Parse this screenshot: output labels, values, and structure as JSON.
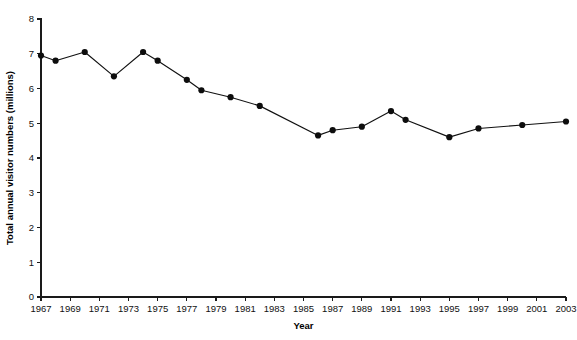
{
  "chart_data": {
    "type": "line",
    "title": "",
    "xlabel": "Year",
    "ylabel": "Total annual visitor numbers (millions)",
    "xlim": [
      1967,
      2003
    ],
    "ylim": [
      0,
      8
    ],
    "grid": false,
    "legend": false,
    "marker": "filled-circle",
    "x_tick_labels": [
      "1967",
      "1969",
      "1971",
      "1973",
      "1975",
      "1977",
      "1979",
      "1981",
      "1983",
      "1985",
      "1987",
      "1989",
      "1991",
      "1993",
      "1995",
      "1997",
      "1999",
      "2001",
      "2003"
    ],
    "x_ticks": [
      1967,
      1969,
      1971,
      1973,
      1975,
      1977,
      1979,
      1981,
      1983,
      1985,
      1987,
      1989,
      1991,
      1993,
      1995,
      1997,
      1999,
      2001,
      2003
    ],
    "y_tick_labels": [
      "0",
      "1",
      "2",
      "3",
      "4",
      "5",
      "6",
      "7",
      "8"
    ],
    "y_ticks": [
      0,
      1,
      2,
      3,
      4,
      5,
      6,
      7,
      8
    ],
    "series": [
      {
        "name": "Total annual visitor numbers",
        "color": "#111111",
        "x": [
          1967,
          1968,
          1970,
          1972,
          1974,
          1975,
          1977,
          1978,
          1980,
          1982,
          1986,
          1987,
          1989,
          1991,
          1992,
          1995,
          1997,
          2000,
          2003
        ],
        "values": [
          6.95,
          6.8,
          7.05,
          6.35,
          7.05,
          6.8,
          6.25,
          5.95,
          5.75,
          5.5,
          4.65,
          4.8,
          4.9,
          5.35,
          5.1,
          4.6,
          4.85,
          4.95,
          5.05
        ]
      }
    ]
  }
}
